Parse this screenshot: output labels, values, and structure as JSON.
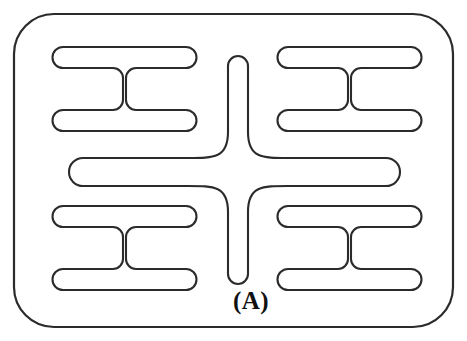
{
  "figure": {
    "label": "(A)",
    "caption_position": {
      "x": 251,
      "y": 309
    },
    "title": "",
    "background_color": "#ffffff",
    "line_color": "#2b2b2b",
    "line_width": 2.1,
    "canvas": {
      "width": 467,
      "height": 341
    },
    "frame": {
      "name": "outer-rounded-rectangle-border",
      "x": 13,
      "y": 13,
      "width": 441,
      "height": 315,
      "corner_radius": 40
    },
    "center_cross": {
      "name": "central-four-arm-cross",
      "center_x": 238,
      "center_y": 172,
      "stem_top_y": 56,
      "stem_bottom_y": 284,
      "stem_half_width": 10,
      "arm_left_x": 73,
      "arm_right_x": 396,
      "arm_half_height": 14,
      "fillet_radius": 40
    },
    "quadrant_shapes": [
      {
        "name": "h-shape-top-left",
        "position": "top-left",
        "x": 53,
        "y": 47,
        "width": 143,
        "height": 84,
        "bar_thickness": 21,
        "web_width": 30,
        "corner_radius": 10
      },
      {
        "name": "h-shape-top-right",
        "position": "top-right",
        "x": 278,
        "y": 47,
        "width": 143,
        "height": 84,
        "bar_thickness": 21,
        "web_width": 30,
        "corner_radius": 10
      },
      {
        "name": "h-shape-bottom-left",
        "position": "bottom-left",
        "x": 53,
        "y": 206,
        "width": 143,
        "height": 84,
        "bar_thickness": 21,
        "web_width": 30,
        "corner_radius": 10
      },
      {
        "name": "h-shape-bottom-right",
        "position": "bottom-right",
        "x": 278,
        "y": 206,
        "width": 143,
        "height": 84,
        "bar_thickness": 21,
        "web_width": 30,
        "corner_radius": 10
      }
    ]
  }
}
